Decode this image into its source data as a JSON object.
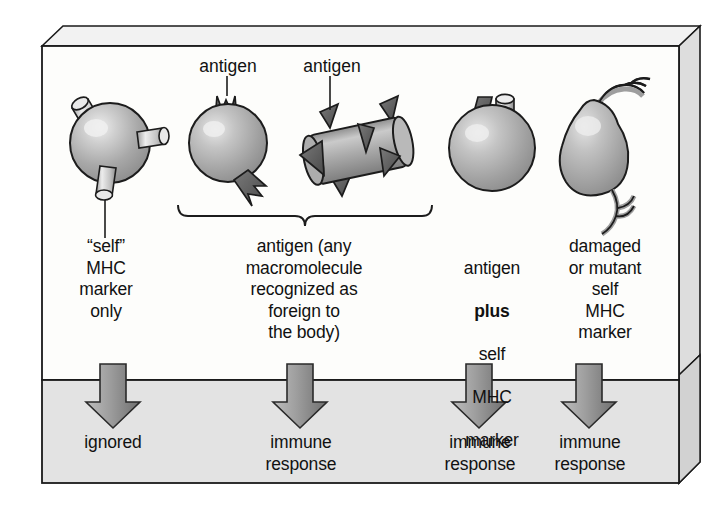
{
  "figure": {
    "title_present": false,
    "callouts": [
      {
        "name": "antigen-callout-left",
        "text": "antigen"
      },
      {
        "name": "antigen-callout-right",
        "text": "antigen"
      }
    ],
    "columns": [
      {
        "id": "self-mhc-only",
        "illustration": "sphere-with-three-mhc-markers",
        "label": "“self”\nMHC\nmarker\nonly",
        "label_lines": [
          "“self”",
          "MHC",
          "marker",
          "only"
        ],
        "outcome": "ignored",
        "outcome_lines": [
          "ignored"
        ]
      },
      {
        "id": "antigen-any-macromolecule",
        "illustration": "spiked-sphere-and-spiked-rod",
        "label": "antigen (any\nmacromolecule\nrecognized as\nforeign to\nthe body)",
        "label_lines": [
          "antigen (any",
          "macromolecule",
          "recognized as",
          "foreign to",
          "the body)"
        ],
        "outcome": "immune\nresponse",
        "outcome_lines": [
          "immune",
          "response"
        ],
        "bracketed": true
      },
      {
        "id": "antigen-plus-self-mhc",
        "illustration": "sphere-with-antigen-cone-and-mhc-cylinder",
        "label_lines": [
          "antigen",
          "plus",
          "self",
          "MHC",
          "marker"
        ],
        "label_line1": "antigen",
        "label_line2_bold": "plus",
        "label_line3": "self",
        "label_line4": "MHC",
        "label_line5": "marker",
        "outcome": "immune\nresponse",
        "outcome_lines": [
          "immune",
          "response"
        ]
      },
      {
        "id": "damaged-or-mutant-self-mhc",
        "illustration": "deformed-cell-with-branched-appendages",
        "label": "damaged\nor mutant\nself\nMHC\nmarker",
        "label_lines": [
          "damaged",
          "or mutant",
          "self",
          "MHC",
          "marker"
        ],
        "outcome": "immune\nresponse",
        "outcome_lines": [
          "immune",
          "response"
        ]
      }
    ],
    "colors": {
      "frame_outline": "#1a1a1a",
      "panel_top_background": "#fdfdfb",
      "panel_bottom_background": "#e2e2e2",
      "box_side_face": "#dcdcdc",
      "box_top_face": "#f0f0f0",
      "cell_fill_light": "#d8d8d8",
      "cell_fill_mid": "#9a9a9a",
      "cell_outline": "#1c1c1c",
      "antigen_spike_dark": "#5b5b5b",
      "arrow_fill_light": "#b4b4b4",
      "arrow_fill_dark": "#7a7a7a",
      "text": "#111111"
    }
  }
}
